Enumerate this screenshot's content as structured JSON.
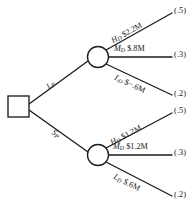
{
  "diagram": {
    "type": "decision-tree",
    "title": "",
    "background_color": "#ffffff",
    "line_color": "#1d1d1d",
    "nodes": [
      {
        "id": "decision",
        "shape": "square",
        "label": ""
      },
      {
        "id": "chance_upper",
        "shape": "circle",
        "label": ""
      },
      {
        "id": "chance_lower",
        "shape": "circle",
        "label": ""
      }
    ],
    "decision_branches": [
      {
        "id": "branch_lp",
        "label_main": "L",
        "label_sub": "P",
        "target": "chance_upper"
      },
      {
        "id": "branch_sp",
        "label_main": "S",
        "label_sub": "P",
        "target": "chance_lower"
      }
    ],
    "upper_outcomes": [
      {
        "state_main": "H",
        "state_sub": "D",
        "payoff": "$2.2M",
        "probability": "(.5)"
      },
      {
        "state_main": "M",
        "state_sub": "D",
        "payoff": "$.8M",
        "probability": "(.3)"
      },
      {
        "state_main": "L",
        "state_sub": "D",
        "payoff": "$−.6M",
        "probability": "(.2)"
      }
    ],
    "lower_outcomes": [
      {
        "state_main": "H",
        "state_sub": "D",
        "payoff": "$1.2M",
        "probability": "(.5)"
      },
      {
        "state_main": "M",
        "state_sub": "D",
        "payoff": "$1.2M",
        "probability": "(.3)"
      },
      {
        "state_main": "L",
        "state_sub": "D",
        "payoff": "$.6M",
        "probability": "(.2)"
      }
    ]
  }
}
